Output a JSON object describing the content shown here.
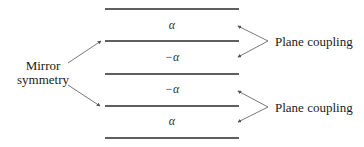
{
  "diagram": {
    "layers": [
      {
        "label": "α"
      },
      {
        "label": "−α"
      },
      {
        "label": "−α"
      },
      {
        "label": "α"
      }
    ],
    "left_annotation": {
      "lines": [
        "Mirror",
        "symmetry"
      ]
    },
    "right_annotations": [
      {
        "label": "Plane coupling"
      },
      {
        "label": "Plane coupling"
      }
    ],
    "colors": {
      "plane_line": "#2a2a2a",
      "arrow": "#555555",
      "text": "#1a1a1a"
    }
  }
}
